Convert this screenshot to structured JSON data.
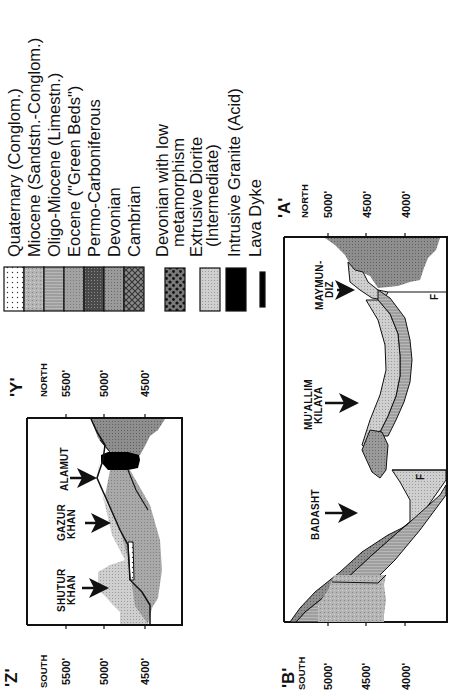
{
  "legend": {
    "sedimentary": [
      {
        "label": "Quaternary (Conglom.)",
        "pattern": "dots",
        "color": "#ffffff"
      },
      {
        "label": "Miocene (Sandstn.-Conglom.)",
        "pattern": "mottled",
        "color": "#b0b0b0"
      },
      {
        "label": "Oligo-Miocene (Limestn.)",
        "pattern": "fine-lines",
        "color": "#9a9a9a"
      },
      {
        "label": "Eocene (\"Green Beds\")",
        "pattern": "medium-gray",
        "color": "#a6a6a6"
      },
      {
        "label": "Permo-Carboniferous",
        "pattern": "dark-stipple",
        "color": "#4a4a4a"
      },
      {
        "label": "Devonian",
        "pattern": "gray-stipple",
        "color": "#8c8c8c"
      },
      {
        "label": "Cambrian",
        "pattern": "crosshatch",
        "color": "#5a5a5a"
      }
    ],
    "igneous": [
      {
        "label_line1": "Devonian with low",
        "label_line2": "metamorphism",
        "pattern": "dark-dots",
        "color": "#6a6a6a"
      },
      {
        "label_line1": "Extrusive Diorite",
        "label_line2": "(Intermediate)",
        "pattern": "light-stipple",
        "color": "#c4c4c4"
      },
      {
        "label_line1": "Intrusive Granite (Acid)",
        "label_line2": "",
        "pattern": "solid",
        "color": "#000000"
      },
      {
        "label_line1": "Lava Dyke",
        "label_line2": "",
        "pattern": "bar",
        "color": "#000000"
      }
    ]
  },
  "section_zy": {
    "left_end": {
      "label": "'Z'",
      "direction": "SOUTH"
    },
    "right_end": {
      "label": "'Y'",
      "direction": "NORTH"
    },
    "elevations_left": [
      "5500'",
      "5000'",
      "4500'"
    ],
    "elevations_right": [
      "5500'",
      "5000'",
      "4500'"
    ],
    "locations": [
      {
        "line1": "SHUTUR",
        "line2": "KHAN"
      },
      {
        "line1": "GAZUR",
        "line2": "KHAN"
      },
      {
        "line1": "ALAMUT",
        "line2": ""
      }
    ]
  },
  "section_ba": {
    "left_end": {
      "label": "'B'",
      "direction": "SOUTH"
    },
    "right_end": {
      "label": "'A'",
      "direction": "NORTH"
    },
    "elevations_left": [
      "5000'",
      "4500'",
      "4000'"
    ],
    "elevations_right": [
      "5000'",
      "4500'",
      "4000'"
    ],
    "locations": [
      {
        "line1": "BADASHT",
        "line2": ""
      },
      {
        "line1": "MU'ALLIM",
        "line2": "KILAYA"
      },
      {
        "line1": "MAYMUN-",
        "line2": "DIZ"
      }
    ],
    "fault_label": "F"
  }
}
